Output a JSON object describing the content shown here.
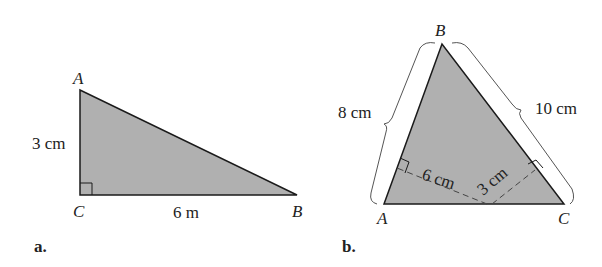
{
  "colors": {
    "fill": "#b0b0b0",
    "stroke": "#1a1a1a",
    "brace": "#555555"
  },
  "figure_a": {
    "sublabel": "a.",
    "vertices": {
      "A": "A",
      "B": "B",
      "C": "C"
    },
    "side_labels": {
      "AC": "3 cm",
      "CB": "6 m"
    },
    "right_angle_at": "C"
  },
  "figure_b": {
    "sublabel": "b.",
    "vertices": {
      "A": "A",
      "B": "B",
      "C": "C"
    },
    "side_labels": {
      "AB": "8 cm",
      "BC": "10 cm"
    },
    "altitude_labels": {
      "to_AB": "6 cm",
      "to_BC": "3 cm"
    }
  }
}
